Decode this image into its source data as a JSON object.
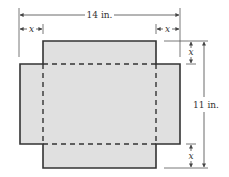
{
  "diagram": {
    "type": "box-net-figure",
    "labels": {
      "width": "14 in.",
      "height": "11 in.",
      "cut_left": "x",
      "cut_right": "x",
      "cut_top": "x",
      "cut_bottom": "x"
    },
    "colors": {
      "fill": "#e0e0e0",
      "outline": "#333333",
      "dimension": "#555555"
    }
  }
}
